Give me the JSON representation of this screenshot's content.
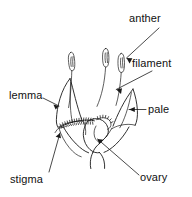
{
  "figure": {
    "background_color": "#ffffff",
    "ink_color": "#1a1a1a",
    "width": 192,
    "height": 197,
    "labels": [
      {
        "id": "anther",
        "text": "anther",
        "x": 129,
        "y": 22,
        "anchor": "start"
      },
      {
        "id": "filament",
        "text": "filament",
        "x": 132,
        "y": 67,
        "anchor": "start"
      },
      {
        "id": "lemma",
        "text": "lemma",
        "x": 9,
        "y": 99,
        "anchor": "start"
      },
      {
        "id": "pale",
        "text": "pale",
        "x": 148,
        "y": 113,
        "anchor": "start"
      },
      {
        "id": "stigma",
        "text": "stigma",
        "x": 10,
        "y": 183,
        "anchor": "start"
      },
      {
        "id": "ovary",
        "text": "ovary",
        "x": 140,
        "y": 181,
        "anchor": "start"
      }
    ],
    "parts": [
      {
        "id": "anther",
        "name": "anther",
        "description": "three elongated capsule-shaped pollen sacs held above the floret"
      },
      {
        "id": "filament",
        "name": "filament",
        "description": "slender stalk supporting each anther"
      },
      {
        "id": "lemma",
        "name": "lemma",
        "description": "outer lower bract enclosing the floret, left side"
      },
      {
        "id": "pale",
        "name": "pale",
        "description": "inner upper bract, right side"
      },
      {
        "id": "stigma",
        "name": "stigma",
        "description": "feathery bristled receptive surface at lower left"
      },
      {
        "id": "ovary",
        "name": "ovary",
        "description": "swollen seed-bearing body at the centre base of the floret"
      }
    ]
  }
}
